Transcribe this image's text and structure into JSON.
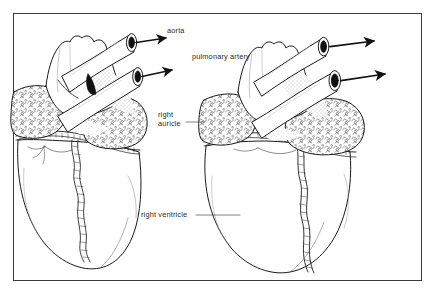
{
  "figure": {
    "kind": "anatomical-line-drawing",
    "views": 2,
    "background_color": "#ffffff",
    "ink_color": "#1a1a1a",
    "frame_color": "#3a3a3a"
  },
  "labels": [
    {
      "id": "aorta",
      "text": "aorta",
      "line2": "",
      "x": 167,
      "y": 30,
      "leader": "arrow"
    },
    {
      "id": "pulmonary-artery",
      "text": "pulmonary artery",
      "line2": "",
      "x": 192,
      "y": 55,
      "leader": "arrow"
    },
    {
      "id": "right-auricle",
      "text": "right",
      "line2": "auricle",
      "x": 158,
      "y": 112,
      "leader": "line"
    },
    {
      "id": "right-ventricle",
      "text": "right ventricle",
      "line2": "",
      "x": 141,
      "y": 209,
      "leader": "line"
    }
  ],
  "structures": {
    "aorta_label": "aorta",
    "pulmonary_artery_label": "pulmonary artery",
    "right_auricle_label_line1": "right",
    "right_auricle_label_line2": "auricle",
    "right_ventricle_label": "right ventricle"
  },
  "left_view": {
    "name": "left-heart-view",
    "vessels": [
      "aorta",
      "pulmonary artery"
    ],
    "arrows": 2
  },
  "right_view": {
    "name": "right-heart-view",
    "vessels": [
      "aorta",
      "pulmonary artery"
    ],
    "arrows": 2
  }
}
